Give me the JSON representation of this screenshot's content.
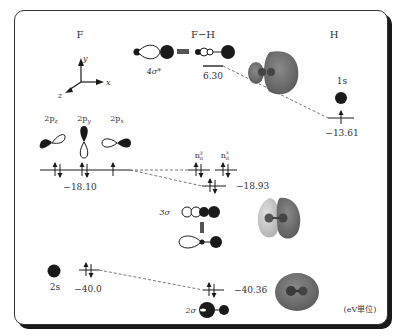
{
  "columns": {
    "left": "F",
    "middle": "F−H",
    "right": "H"
  },
  "axes": {
    "x": "x",
    "y": "y",
    "z": "z"
  },
  "atomic_orbitals_F": [
    {
      "label": "2p",
      "sub": "z"
    },
    {
      "label": "2p",
      "sub": "y"
    },
    {
      "label": "2p",
      "sub": "x"
    }
  ],
  "F_2p_energy": "−18.10",
  "F_2s_label": "2s",
  "F_2s_energy": "−40.0",
  "H_1s_label": "1s",
  "H_1s_energy": "−13.61",
  "mo": {
    "antibonding_label": "4σ*",
    "antibonding_energy": "6.30",
    "nonbonding": [
      {
        "label": "n",
        "sup": "y",
        "sub": "π"
      },
      {
        "label": "n",
        "sup": "x",
        "sub": "π"
      }
    ],
    "sigma3_label": "3σ",
    "sigma3_energy": "−18.93",
    "sigma2_label": "2σ",
    "sigma2_energy": "−40.36"
  },
  "unit_note": "(eV単位)",
  "colors": {
    "ink": "#1a1a1a",
    "isosurface_dark": "#6e6e6e",
    "isosurface_light": "#c9c9c9",
    "dash": "#555555"
  }
}
